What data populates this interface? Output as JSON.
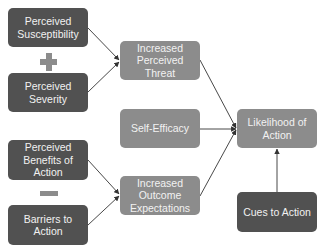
{
  "diagram": {
    "title": "",
    "nodes": {
      "perceived_susceptibility": "Perceived Susceptibility",
      "perceived_severity": "Perceived Severity",
      "perceived_benefits": "Perceived Benefits of Action",
      "barriers": "Barriers to Action",
      "increased_perceived_threat": "Increased Perceived Threat",
      "self_efficacy": "Self-Efficacy",
      "increased_outcome_expectations": "Increased Outcome Expectations",
      "likelihood_of_action": "Likelihood of Action",
      "cues_to_action": "Cues to Action"
    },
    "operators": {
      "plus": "+",
      "minus": "−"
    },
    "edges": [
      {
        "from": "perceived_susceptibility",
        "to": "increased_perceived_threat"
      },
      {
        "from": "perceived_severity",
        "to": "increased_perceived_threat"
      },
      {
        "from": "perceived_benefits",
        "to": "increased_outcome_expectations"
      },
      {
        "from": "barriers",
        "to": "increased_outcome_expectations"
      },
      {
        "from": "increased_perceived_threat",
        "to": "likelihood_of_action"
      },
      {
        "from": "self_efficacy",
        "to": "likelihood_of_action"
      },
      {
        "from": "increased_outcome_expectations",
        "to": "likelihood_of_action"
      },
      {
        "from": "cues_to_action",
        "to": "likelihood_of_action"
      }
    ],
    "colors": {
      "dark_box": "#515151",
      "mid_box": "#8c8c8c",
      "text": "#f2f2f2",
      "arrow": "#333333"
    }
  }
}
